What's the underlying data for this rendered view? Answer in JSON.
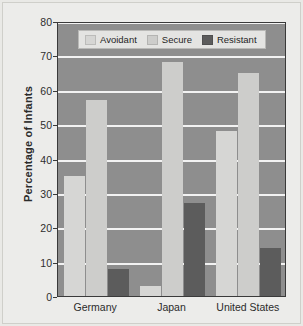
{
  "chart_data": {
    "type": "bar",
    "title": "",
    "subtitle": "",
    "xlabel": "",
    "ylabel": "Percentage of Infants",
    "categories": [
      "Germany",
      "Japan",
      "United States"
    ],
    "series": [
      {
        "name": "Avoidant",
        "values": [
          35,
          3,
          48
        ],
        "color": "#d6d6d4"
      },
      {
        "name": "Secure",
        "values": [
          57,
          68,
          65
        ],
        "color": "#cdcdcb"
      },
      {
        "name": "Resistant",
        "values": [
          8,
          27,
          14
        ],
        "color": "#5c5c5c"
      }
    ],
    "ylim": [
      0,
      80
    ],
    "yticks": [
      0,
      10,
      20,
      30,
      40,
      50,
      60,
      70,
      80
    ],
    "ytick_labels": [
      "0",
      "10",
      "20",
      "30",
      "40",
      "50",
      "60",
      "70",
      "80"
    ],
    "grid": true,
    "grid_color": "#f2f2f2",
    "plot_background": "#8e8e8e",
    "page_background": "#e9e9e6",
    "legend_position": "top-left-inside",
    "legend_entries": [
      "Avoidant",
      "Secure",
      "Resistant"
    ]
  }
}
